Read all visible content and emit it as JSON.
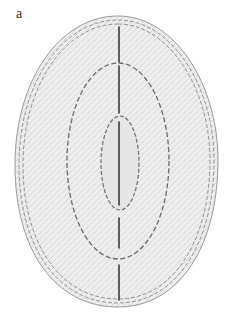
{
  "figure": {
    "panel_label": "a",
    "colors": {
      "fill": "#ececec",
      "stipple": "#d6d6d6",
      "outline": "#8a8a8a",
      "dashed_inner": "#6e6e6e",
      "axis_line": "#3a3a3a"
    },
    "outer_outline": {
      "style": "triple dashed",
      "left": 15,
      "right": 218,
      "top": 16,
      "bottom": 307
    },
    "middle_ellipse": {
      "style": "dashed",
      "cx": 118,
      "cy": 161,
      "rx": 51,
      "ry": 98
    },
    "inner_ellipse": {
      "style": "dashed",
      "cx": 120,
      "cy": 163,
      "rx": 19,
      "ry": 47
    },
    "central_axis": {
      "style": "solid segmented",
      "x": 119,
      "segments": [
        [
          27,
          62
        ],
        [
          66,
          113
        ],
        [
          122,
          205
        ],
        [
          218,
          248
        ],
        [
          265,
          300
        ]
      ]
    }
  }
}
